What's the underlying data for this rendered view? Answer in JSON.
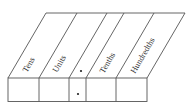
{
  "diagram": {
    "columns": [
      {
        "label": "Tens"
      },
      {
        "label": "Units"
      },
      {
        "label": "",
        "is_decimal_point": true
      },
      {
        "label": "Tenths"
      },
      {
        "label": "Hundredths"
      }
    ],
    "decimal_point_symbol": "•",
    "colors": {
      "line": "#555555",
      "text": "#333333"
    }
  }
}
